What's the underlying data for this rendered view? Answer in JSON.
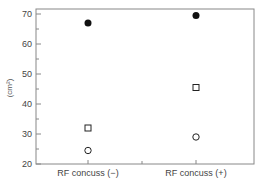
{
  "chart_data": {
    "type": "scatter",
    "title": "",
    "xlabel": "",
    "ylabel": "(cm²)",
    "ylim": [
      20,
      70
    ],
    "yticks": [
      20,
      30,
      40,
      50,
      60,
      70
    ],
    "ytick_labels": [
      "20",
      "30",
      "40",
      "50",
      "60",
      "70"
    ],
    "categories": [
      "RF concuss (−)",
      "RF concuss (+)"
    ],
    "grid": false,
    "legend": null,
    "series": [
      {
        "name": "filled circle",
        "marker": "filled-circle",
        "values": [
          67,
          69.5
        ]
      },
      {
        "name": "open square",
        "marker": "open-square",
        "values": [
          32,
          45.5
        ]
      },
      {
        "name": "open circle",
        "marker": "open-circle",
        "values": [
          24.5,
          29
        ]
      }
    ]
  }
}
